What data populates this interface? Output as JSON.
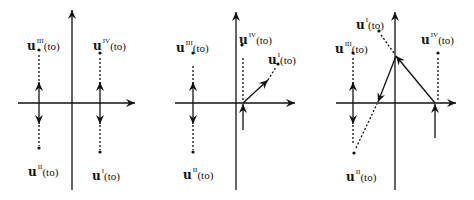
{
  "diagram": {
    "colors": {
      "stroke": "#111111",
      "background": "#ffffff"
    },
    "panels": [
      {
        "id": "panel-1",
        "axes": {
          "origin": [
            72,
            103
          ],
          "x_range": [
            18,
            135
          ],
          "y_range": [
            10,
            190
          ]
        },
        "points": [
          {
            "name": "III",
            "label_base": "u",
            "label_sup": "III",
            "label_arg": "(to)",
            "dot": [
              39,
              50
            ],
            "label_pos": [
              27,
              34
            ]
          },
          {
            "name": "IV",
            "label_base": "u",
            "label_sup": "IV",
            "label_arg": "(to)",
            "dot": [
              100,
              53
            ],
            "label_pos": [
              93,
              34
            ]
          },
          {
            "name": "II",
            "label_base": "u",
            "label_sup": "II",
            "label_arg": "(to)",
            "dot": [
              39,
              148
            ],
            "label_pos": [
              28,
              160
            ]
          },
          {
            "name": "I",
            "label_base": "u",
            "label_sup": "I",
            "label_arg": "(to)",
            "dot": [
              100,
              152
            ],
            "label_pos": [
              92,
              164
            ]
          }
        ],
        "dashed": [
          [
            [
              39,
              55
            ],
            [
              39,
              85
            ]
          ],
          [
            [
              39,
              121
            ],
            [
              39,
              146
            ]
          ],
          [
            [
              100,
              58
            ],
            [
              100,
              85
            ]
          ],
          [
            [
              100,
              121
            ],
            [
              100,
              150
            ]
          ]
        ],
        "arrows": [
          [
            [
              39,
              103
            ],
            [
              39,
              82
            ]
          ],
          [
            [
              39,
              103
            ],
            [
              39,
              124
            ]
          ],
          [
            [
              100,
              103
            ],
            [
              100,
              82
            ]
          ],
          [
            [
              100,
              103
            ],
            [
              100,
              124
            ]
          ]
        ]
      },
      {
        "id": "panel-2",
        "axes": {
          "origin": [
            236,
            103
          ],
          "x_range": [
            175,
            295
          ],
          "y_range": [
            12,
            190
          ]
        },
        "points": [
          {
            "name": "III",
            "label_base": "u",
            "label_sup": "III",
            "label_arg": "(to)",
            "dot": [
              193,
              53
            ],
            "label_pos": [
              176,
              36
            ]
          },
          {
            "name": "IV",
            "label_base": "u",
            "label_sup": "IV",
            "label_arg": "(to)",
            "dot": [
              242,
              45
            ],
            "label_pos": [
              239,
              28
            ]
          },
          {
            "name": "I",
            "label_base": "u",
            "label_sup": "I",
            "label_arg": "(to)",
            "dot": [
              278,
              64
            ],
            "label_pos": [
              268,
              48
            ]
          },
          {
            "name": "II",
            "label_base": "u",
            "label_sup": "II",
            "label_arg": "(to)",
            "dot": [
              193,
              152
            ],
            "label_pos": [
              183,
              163
            ]
          }
        ],
        "dashed": [
          [
            [
              193,
              66
            ],
            [
              193,
              85
            ]
          ],
          [
            [
              193,
              121
            ],
            [
              193,
              150
            ]
          ],
          [
            [
              243,
              58
            ],
            [
              243,
              100
            ]
          ],
          [
            [
              268,
              80
            ],
            [
              276,
              67
            ]
          ]
        ],
        "arrows": [
          [
            [
              193,
              103
            ],
            [
              193,
              82
            ]
          ],
          [
            [
              193,
              103
            ],
            [
              193,
              124
            ]
          ],
          [
            [
              243,
              130
            ],
            [
              243,
              104
            ]
          ],
          [
            [
              243,
              103
            ],
            [
              268,
              80
            ]
          ]
        ]
      },
      {
        "id": "panel-3",
        "axes": {
          "origin": [
            395,
            103
          ],
          "x_range": [
            336,
            456
          ],
          "y_range": [
            12,
            190
          ]
        },
        "points": [
          {
            "name": "I",
            "label_base": "u",
            "label_sup": "I",
            "label_arg": "(to)",
            "dot": [
              379,
              31
            ],
            "label_pos": [
              356,
              13
            ]
          },
          {
            "name": "III",
            "label_base": "u",
            "label_sup": "III",
            "label_arg": "(to)",
            "dot": [
              353,
              53
            ],
            "label_pos": [
              335,
              37
            ]
          },
          {
            "name": "IV",
            "label_base": "u",
            "label_sup": "IV",
            "label_arg": "(to)",
            "dot": [
              438,
              53
            ],
            "label_pos": [
              421,
              28
            ]
          },
          {
            "name": "II",
            "label_base": "u",
            "label_sup": "II",
            "label_arg": "(to)",
            "dot": [
              354,
              153
            ],
            "label_pos": [
              346,
              165
            ]
          }
        ],
        "dashed": [
          [
            [
              381,
              35
            ],
            [
              394,
              53
            ]
          ],
          [
            [
              353,
              58
            ],
            [
              353,
              85
            ]
          ],
          [
            [
              353,
              121
            ],
            [
              353,
              145
            ]
          ],
          [
            [
              438,
              58
            ],
            [
              438,
              101
            ]
          ],
          [
            [
              356,
              148
            ],
            [
              377,
              104
            ]
          ]
        ],
        "arrows": [
          [
            [
              353,
              103
            ],
            [
              353,
              82
            ]
          ],
          [
            [
              353,
              103
            ],
            [
              353,
              124
            ]
          ],
          [
            [
              435,
              138
            ],
            [
              435,
              104
            ]
          ],
          [
            [
              435,
              103
            ],
            [
              396,
              56
            ]
          ],
          [
            [
              396,
              56
            ],
            [
              378,
              102
            ]
          ]
        ]
      }
    ]
  }
}
